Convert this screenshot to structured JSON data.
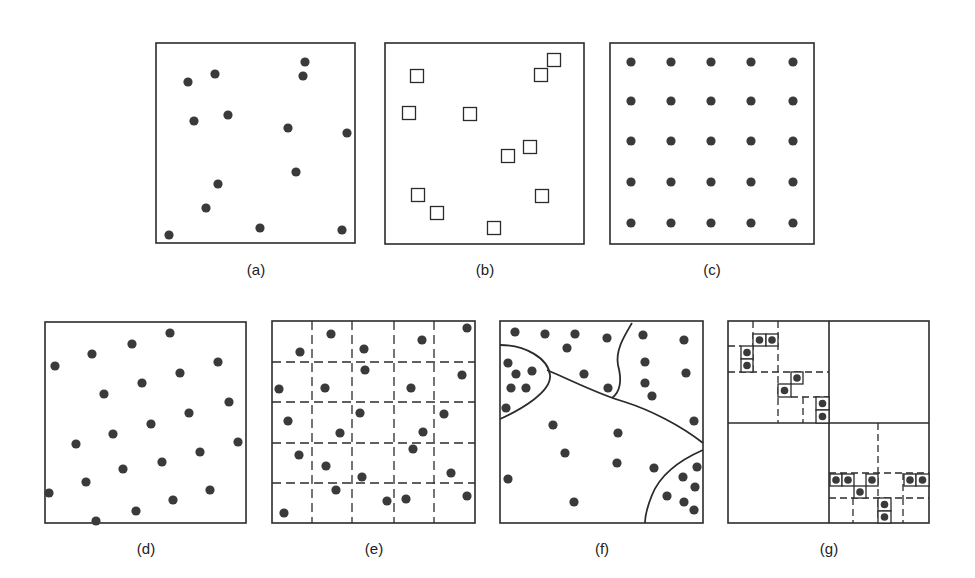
{
  "figure": {
    "colors": {
      "ink": "#2b2b2b",
      "dot": "#3a3a3a",
      "background": "#ffffff"
    },
    "panels": [
      {
        "id": "a",
        "label": "(a)",
        "type": "random-points",
        "box": [
          156,
          43,
          199,
          200
        ],
        "label_pos": [
          256,
          269
        ],
        "marker": "dot",
        "points": [
          [
            188,
            82
          ],
          [
            215,
            74
          ],
          [
            305,
            62
          ],
          [
            303,
            76
          ],
          [
            194,
            121
          ],
          [
            228,
            115
          ],
          [
            288,
            128
          ],
          [
            347,
            133
          ],
          [
            296,
            172
          ],
          [
            218,
            184
          ],
          [
            206,
            208
          ],
          [
            260,
            228
          ],
          [
            342,
            230
          ],
          [
            169,
            235
          ]
        ]
      },
      {
        "id": "b",
        "label": "(b)",
        "type": "random-squares",
        "box": [
          385,
          43,
          199,
          201
        ],
        "label_pos": [
          485,
          269
        ],
        "marker": "square",
        "points": [
          [
            417,
            76
          ],
          [
            554,
            60
          ],
          [
            541,
            75
          ],
          [
            409,
            113
          ],
          [
            470,
            114
          ],
          [
            530,
            147
          ],
          [
            508,
            156
          ],
          [
            418,
            195
          ],
          [
            542,
            196
          ],
          [
            437,
            213
          ],
          [
            494,
            228
          ]
        ]
      },
      {
        "id": "c",
        "label": "(c)",
        "type": "regular-grid",
        "box": [
          610,
          43,
          204,
          201
        ],
        "label_pos": [
          712,
          269
        ],
        "marker": "dot",
        "grid_x": [
          631,
          671,
          711,
          751,
          793
        ],
        "grid_y": [
          62,
          101,
          141,
          182,
          223
        ]
      },
      {
        "id": "d",
        "label": "(d)",
        "type": "stratified-points",
        "box": [
          45,
          322,
          201,
          201
        ],
        "label_pos": [
          146,
          548
        ],
        "marker": "dot",
        "points": [
          [
            170,
            333
          ],
          [
            132,
            344
          ],
          [
            92,
            354
          ],
          [
            55,
            366
          ],
          [
            218,
            362
          ],
          [
            180,
            373
          ],
          [
            142,
            383
          ],
          [
            104,
            394
          ],
          [
            229,
            402
          ],
          [
            189,
            413
          ],
          [
            151,
            424
          ],
          [
            113,
            434
          ],
          [
            238,
            442
          ],
          [
            200,
            452
          ],
          [
            162,
            462
          ],
          [
            76,
            444
          ],
          [
            123,
            469
          ],
          [
            86,
            482
          ],
          [
            210,
            490
          ],
          [
            173,
            500
          ],
          [
            136,
            511
          ],
          [
            49,
            493
          ],
          [
            96,
            521
          ]
        ]
      },
      {
        "id": "e",
        "label": "(e)",
        "type": "grid-sampled",
        "box": [
          272,
          321,
          203,
          202
        ],
        "label_pos": [
          374,
          548
        ],
        "marker": "dot",
        "dashed_v": [
          312,
          352,
          394,
          434
        ],
        "dashed_h": [
          362,
          402,
          443,
          483
        ],
        "points": [
          [
            331,
            334
          ],
          [
            467,
            328
          ],
          [
            300,
            352
          ],
          [
            364,
            349
          ],
          [
            422,
            340
          ],
          [
            462,
            375
          ],
          [
            279,
            389
          ],
          [
            325,
            388
          ],
          [
            365,
            370
          ],
          [
            411,
            388
          ],
          [
            288,
            421
          ],
          [
            360,
            413
          ],
          [
            444,
            414
          ],
          [
            340,
            433
          ],
          [
            423,
            432
          ],
          [
            299,
            455
          ],
          [
            413,
            449
          ],
          [
            326,
            466
          ],
          [
            362,
            477
          ],
          [
            451,
            473
          ],
          [
            336,
            490
          ],
          [
            387,
            501
          ],
          [
            406,
            499
          ],
          [
            467,
            496
          ],
          [
            284,
            513
          ]
        ]
      },
      {
        "id": "f",
        "label": "(f)",
        "type": "region-partition",
        "box": [
          500,
          321,
          203,
          202
        ],
        "label_pos": [
          602,
          548
        ],
        "marker": "dot",
        "boundaries": [
          "M500,345 C525,345 548,358 550,375 C552,392 520,410 500,419",
          "M547,370 C575,382 600,395 625,402 C650,410 680,425 703,443",
          "M632,323 C625,335 615,350 618,365 C622,380 620,392 612,398",
          "M703,450 C680,460 660,475 652,495 C648,505 645,515 645,523"
        ],
        "points": [
          [
            515,
            332
          ],
          [
            545,
            334
          ],
          [
            575,
            334
          ],
          [
            607,
            338
          ],
          [
            643,
            335
          ],
          [
            684,
            340
          ],
          [
            567,
            348
          ],
          [
            508,
            363
          ],
          [
            516,
            374
          ],
          [
            532,
            371
          ],
          [
            511,
            388
          ],
          [
            526,
            388
          ],
          [
            584,
            374
          ],
          [
            608,
            388
          ],
          [
            645,
            362
          ],
          [
            686,
            373
          ],
          [
            645,
            383
          ],
          [
            652,
            396
          ],
          [
            506,
            408
          ],
          [
            553,
            425
          ],
          [
            618,
            433
          ],
          [
            565,
            453
          ],
          [
            617,
            463
          ],
          [
            654,
            468
          ],
          [
            508,
            479
          ],
          [
            694,
            421
          ],
          [
            697,
            467
          ],
          [
            683,
            477
          ],
          [
            695,
            487
          ],
          [
            667,
            496
          ],
          [
            684,
            502
          ],
          [
            694,
            510
          ],
          [
            574,
            502
          ]
        ]
      },
      {
        "id": "g",
        "label": "(g)",
        "type": "quadtree",
        "box": [
          728,
          321,
          201,
          202
        ],
        "label_pos": [
          829,
          548
        ],
        "marker": "boxed-dot",
        "solid_lines": [
          [
            829,
            321,
            829,
            523
          ],
          [
            728,
            423,
            929,
            423
          ]
        ],
        "dashed_lines": [
          [
            753,
            321,
            753,
            372
          ],
          [
            778,
            321,
            778,
            423
          ],
          [
            728,
            346,
            741,
            346
          ],
          [
            728,
            372,
            829,
            372
          ],
          [
            803,
            397,
            803,
            423
          ],
          [
            791,
            397,
            829,
            397
          ],
          [
            878,
            423,
            878,
            523
          ],
          [
            829,
            473,
            929,
            473
          ],
          [
            829,
            498,
            929,
            498
          ],
          [
            853,
            498,
            853,
            523
          ],
          [
            903,
            498,
            903,
            523
          ],
          [
            903,
            473,
            903,
            498
          ]
        ],
        "cells": [
          [
            753,
            334,
            13,
            12
          ],
          [
            766,
            334,
            12,
            12
          ],
          [
            741,
            346,
            12,
            13
          ],
          [
            741,
            359,
            12,
            13
          ],
          [
            791,
            372,
            12,
            12
          ],
          [
            778,
            384,
            13,
            13
          ],
          [
            816,
            397,
            13,
            13
          ],
          [
            816,
            410,
            13,
            13
          ],
          [
            830,
            474,
            12,
            12
          ],
          [
            842,
            474,
            12,
            12
          ],
          [
            866,
            474,
            12,
            12
          ],
          [
            854,
            486,
            12,
            12
          ],
          [
            904,
            474,
            12,
            12
          ],
          [
            916,
            474,
            13,
            12
          ],
          [
            878,
            498,
            13,
            13
          ],
          [
            878,
            511,
            13,
            12
          ]
        ]
      }
    ]
  }
}
